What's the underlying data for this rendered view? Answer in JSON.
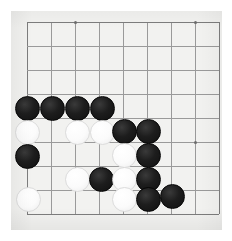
{
  "app": {
    "title": "Go Board Position",
    "board_size": 9,
    "background_color": "#ffffff",
    "board_color": "#f2f2f0",
    "line_color": "#9a9a9a",
    "black_color": "#141414",
    "white_color": "#fdfdfd"
  },
  "board": {
    "origin_x": 27,
    "origin_y": 22,
    "spacing": 24,
    "lines_x": [
      27,
      51,
      75,
      99,
      123,
      147,
      171,
      195,
      219
    ],
    "lines_y": [
      22,
      46,
      70,
      94,
      118,
      142,
      166,
      190,
      214
    ],
    "star_points": [
      {
        "col": 2,
        "row": 0,
        "label": "star-point-top-left"
      },
      {
        "col": 7,
        "row": 0,
        "label": "star-point-top-right"
      },
      {
        "col": 2,
        "row": 5,
        "label": "star-point-center-left"
      },
      {
        "col": 7,
        "row": 5,
        "label": "star-point-center-right"
      }
    ],
    "stone_radius": 12.5,
    "stones": [
      {
        "id": "b1",
        "color": "black",
        "col": 0,
        "row": 3.6,
        "x": 27,
        "y": 108
      },
      {
        "id": "b2",
        "color": "black",
        "col": 1,
        "row": 3.6,
        "x": 52,
        "y": 108
      },
      {
        "id": "b3",
        "color": "black",
        "col": 2,
        "row": 3.6,
        "x": 77,
        "y": 108
      },
      {
        "id": "b4",
        "color": "black",
        "col": 3,
        "row": 3.6,
        "x": 102,
        "y": 108
      },
      {
        "id": "w1",
        "color": "white",
        "col": 0,
        "row": 4.6,
        "x": 27,
        "y": 132
      },
      {
        "id": "w2",
        "color": "white",
        "col": 2,
        "row": 4.6,
        "x": 77,
        "y": 132
      },
      {
        "id": "w3",
        "color": "white",
        "col": 3,
        "row": 4.6,
        "x": 102,
        "y": 132
      },
      {
        "id": "b5",
        "color": "black",
        "col": 4,
        "row": 4.6,
        "x": 124,
        "y": 131
      },
      {
        "id": "b6",
        "color": "black",
        "col": 5,
        "row": 4.6,
        "x": 148,
        "y": 131
      },
      {
        "id": "b7",
        "color": "black",
        "col": 0,
        "row": 5.6,
        "x": 27,
        "y": 156
      },
      {
        "id": "w4",
        "color": "white",
        "col": 4,
        "row": 5.6,
        "x": 124,
        "y": 155
      },
      {
        "id": "b8",
        "color": "black",
        "col": 5,
        "row": 5.6,
        "x": 148,
        "y": 155
      },
      {
        "id": "w5",
        "color": "white",
        "col": 2,
        "row": 6.6,
        "x": 77,
        "y": 179
      },
      {
        "id": "b9",
        "color": "black",
        "col": 3,
        "row": 6.6,
        "x": 101,
        "y": 179
      },
      {
        "id": "w6",
        "color": "white",
        "col": 4,
        "row": 6.6,
        "x": 124,
        "y": 179
      },
      {
        "id": "b10",
        "color": "black",
        "col": 5,
        "row": 6.6,
        "x": 148,
        "y": 179
      },
      {
        "id": "w7",
        "color": "white",
        "col": 0,
        "row": 7.6,
        "x": 28,
        "y": 199
      },
      {
        "id": "w8",
        "color": "white",
        "col": 4,
        "row": 7.6,
        "x": 124,
        "y": 199
      },
      {
        "id": "b11",
        "color": "black",
        "col": 5,
        "row": 7.6,
        "x": 148,
        "y": 199
      },
      {
        "id": "b12",
        "color": "black",
        "col": 6,
        "row": 7.6,
        "x": 172,
        "y": 196
      }
    ]
  }
}
